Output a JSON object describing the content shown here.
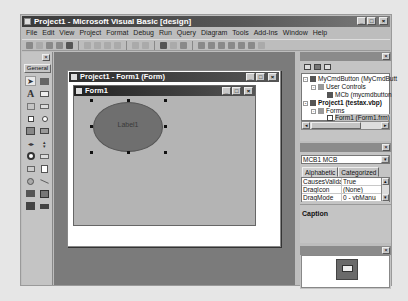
{
  "window": {
    "title": "Project1 - Microsoft Visual Basic [design]",
    "minimize": "_",
    "maximize": "□",
    "close": "×"
  },
  "menu": [
    "File",
    "Edit",
    "View",
    "Project",
    "Format",
    "Debug",
    "Run",
    "Query",
    "Diagram",
    "Tools",
    "Add-Ins",
    "Window",
    "Help"
  ],
  "toolbox": {
    "close": "×",
    "tab_label": "General",
    "tools": [
      "pointer",
      "picturebox",
      "label",
      "textbox",
      "frame",
      "commandbutton",
      "checkbox",
      "optionbutton",
      "combobox",
      "listbox",
      "hscrollbar",
      "vscrollbar",
      "timer",
      "drivelistbox",
      "dirlistbox",
      "filelistbox",
      "shape",
      "line",
      "image",
      "data",
      "ole",
      "mycmdbutton"
    ]
  },
  "form_window": {
    "title": "Project1 - Form1 (Form)",
    "designer_title": "Form1",
    "control_label": "Label1"
  },
  "project_explorer": {
    "title": "",
    "close": "×",
    "tree": [
      {
        "label": "MyCmdButton (MyCmdButt",
        "level": 0,
        "bold": false,
        "expand": "-"
      },
      {
        "label": "User Controls",
        "level": 1,
        "bold": false,
        "expand": "-"
      },
      {
        "label": "MCb (mycmdbutton",
        "level": 2,
        "bold": false,
        "expand": ""
      },
      {
        "label": "Project1 (testax.vbp)",
        "level": 0,
        "bold": true,
        "expand": "-"
      },
      {
        "label": "Forms",
        "level": 1,
        "bold": false,
        "expand": "-"
      },
      {
        "label": "Form1 (Form1.frm)",
        "level": 2,
        "bold": false,
        "expand": "",
        "selected": true
      }
    ]
  },
  "properties": {
    "title": "",
    "close": "×",
    "object": "MCB1 MCB",
    "tabs": [
      "Alphabetic",
      "Categorized"
    ],
    "rows": [
      {
        "name": "CausesValidati",
        "value": "True"
      },
      {
        "name": "DragIcon",
        "value": "(None)"
      },
      {
        "name": "DragMode",
        "value": "0 - vbManual"
      }
    ],
    "description": "Caption"
  },
  "form_layout": {
    "title": "",
    "close": "×"
  }
}
